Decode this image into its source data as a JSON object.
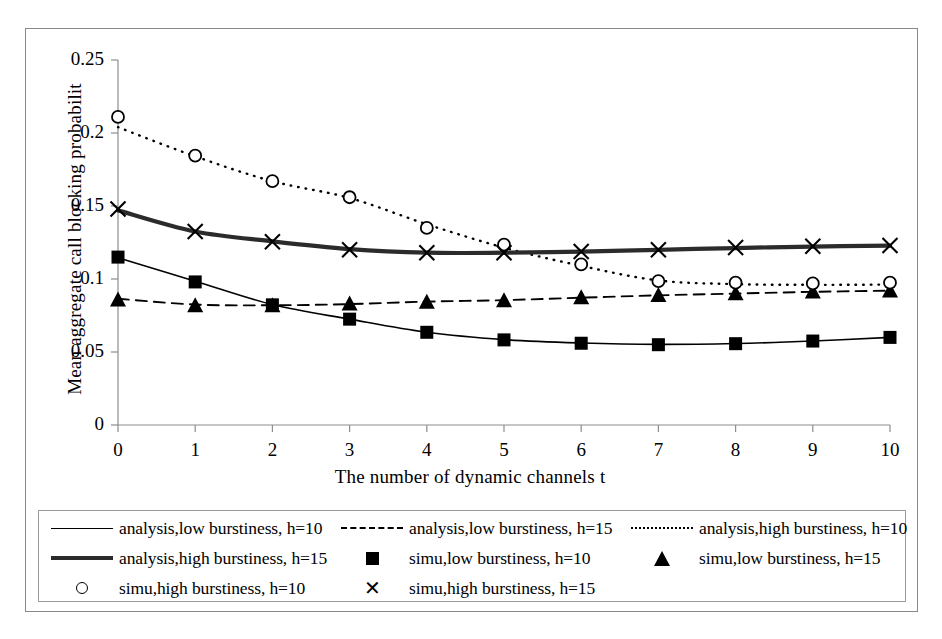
{
  "chart_data": {
    "type": "line",
    "title": "",
    "xlabel": "The number of dynamic channels t",
    "ylabel": "Mean aggregate call blocking probabilit",
    "x": [
      0,
      1,
      2,
      3,
      4,
      5,
      6,
      7,
      8,
      9,
      10
    ],
    "xlim": [
      0,
      10
    ],
    "ylim": [
      0,
      0.25
    ],
    "xticks": [
      "0",
      "1",
      "2",
      "3",
      "4",
      "5",
      "6",
      "7",
      "8",
      "9",
      "10"
    ],
    "yticks": [
      "0",
      "0.05",
      "0.1",
      "0.15",
      "0.2",
      "0.25"
    ],
    "ytick_values": [
      0,
      0.05,
      0.1,
      0.15,
      0.2,
      0.25
    ],
    "grid": false,
    "legend_position": "below-plot",
    "series": [
      {
        "name": "analysis,low burstiness, h=10",
        "style": "solid-thin",
        "marker": "none",
        "color": "#000000",
        "values": [
          0.1145,
          0.0985,
          0.0825,
          0.0725,
          0.0635,
          0.0585,
          0.0562,
          0.0552,
          0.0558,
          0.0575,
          0.06
        ]
      },
      {
        "name": "analysis,low burstiness, h=15",
        "style": "dashed",
        "marker": "none",
        "color": "#000000",
        "values": [
          0.0865,
          0.0825,
          0.082,
          0.0828,
          0.0845,
          0.0855,
          0.0872,
          0.0888,
          0.09,
          0.0912,
          0.092
        ]
      },
      {
        "name": "analysis,high burstiness, h=10",
        "style": "dotted",
        "marker": "none",
        "color": "#000000",
        "values": [
          0.204,
          0.184,
          0.167,
          0.1555,
          0.1375,
          0.1215,
          0.109,
          0.099,
          0.0965,
          0.096,
          0.0962
        ]
      },
      {
        "name": "analysis,high burstiness, h=15",
        "style": "solid-thick",
        "marker": "none",
        "color": "#2b2b2b",
        "values": [
          0.147,
          0.1325,
          0.1258,
          0.1205,
          0.118,
          0.118,
          0.1188,
          0.12,
          0.1212,
          0.1222,
          0.1228
        ]
      },
      {
        "name": "simu,low burstiness, h=10",
        "style": "none",
        "marker": "square",
        "color": "#000000",
        "values": [
          0.115,
          0.098,
          0.0823,
          0.0725,
          0.0635,
          0.0583,
          0.056,
          0.055,
          0.0557,
          0.0575,
          0.06
        ]
      },
      {
        "name": "simu,low burstiness, h=15",
        "style": "none",
        "marker": "triangle",
        "color": "#000000",
        "values": [
          0.086,
          0.082,
          0.082,
          0.0832,
          0.0845,
          0.0855,
          0.0875,
          0.089,
          0.0903,
          0.0915,
          0.0922
        ]
      },
      {
        "name": "simu,high burstiness, h=10",
        "style": "none",
        "marker": "circle",
        "color": "#000000",
        "values": [
          0.211,
          0.1845,
          0.167,
          0.156,
          0.135,
          0.1235,
          0.11,
          0.0985,
          0.0975,
          0.097,
          0.0975
        ]
      },
      {
        "name": "simu,high burstiness, h=15",
        "style": "none",
        "marker": "x",
        "color": "#000000",
        "values": [
          0.148,
          0.1325,
          0.1255,
          0.12,
          0.118,
          0.118,
          0.1188,
          0.12,
          0.1215,
          0.1225,
          0.123
        ]
      }
    ]
  },
  "legend": {
    "entries": [
      {
        "label": "analysis,low burstiness, h=10",
        "symbol": "solid-thin-line"
      },
      {
        "label": "analysis,low burstiness, h=15",
        "symbol": "dashed-line"
      },
      {
        "label": "analysis,high burstiness, h=10",
        "symbol": "dotted-line"
      },
      {
        "label": "analysis,high burstiness, h=15",
        "symbol": "solid-thick-line"
      },
      {
        "label": "simu,low burstiness, h=10",
        "symbol": "filled-square"
      },
      {
        "label": "simu,low burstiness, h=15",
        "symbol": "filled-triangle"
      },
      {
        "label": "simu,high burstiness, h=10",
        "symbol": "open-circle"
      },
      {
        "label": "simu,high burstiness, h=15",
        "symbol": "cross-x"
      }
    ],
    "x_symbol_glyph": "✕"
  }
}
